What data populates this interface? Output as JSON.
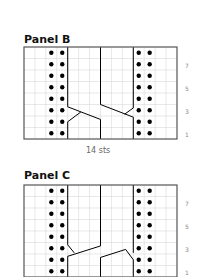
{
  "panels": [
    {
      "title": "Panel B",
      "caption": "14 sts",
      "stitches": 14,
      "rows": 8,
      "row_labels": [
        "1",
        "3",
        "5",
        "7"
      ],
      "purl_columns": [
        3,
        4,
        11,
        12
      ],
      "cable_cross_row_style": "B"
    },
    {
      "title": "Panel C",
      "stitches": 14,
      "rows": 8,
      "row_labels": [
        "1",
        "3",
        "5",
        "7"
      ],
      "purl_columns": [
        3,
        4,
        11,
        12
      ],
      "cable_cross_row_style": "C"
    }
  ],
  "colors": {
    "grid_line": "#d8d8d8",
    "border": "#555555",
    "ink": "#000000",
    "label": "#888888"
  }
}
